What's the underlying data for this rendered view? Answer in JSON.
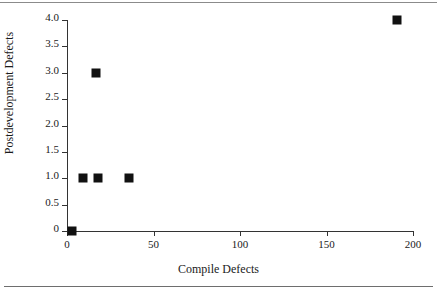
{
  "chart_data": {
    "type": "scatter",
    "title": "",
    "xlabel": "Compile Defects",
    "ylabel": "Postdevelopment Defects",
    "xlim": [
      0,
      200
    ],
    "ylim": [
      0,
      4.0
    ],
    "grid": false,
    "legend": null,
    "x_ticks": [
      {
        "value": 0,
        "label": "0"
      },
      {
        "value": 50,
        "label": "50"
      },
      {
        "value": 100,
        "label": "100"
      },
      {
        "value": 150,
        "label": "150"
      },
      {
        "value": 200,
        "label": "200"
      }
    ],
    "y_ticks": [
      {
        "value": 4.0,
        "label": "4.0"
      },
      {
        "value": 3.5,
        "label": "3.5"
      },
      {
        "value": 3.0,
        "label": "3.0"
      },
      {
        "value": 2.5,
        "label": "2.5"
      },
      {
        "value": 2.0,
        "label": "2.0"
      },
      {
        "value": 1.5,
        "label": "1.5"
      },
      {
        "value": 1.0,
        "label": "1.0"
      },
      {
        "value": 0.5,
        "label": "0.5"
      },
      {
        "value": 0,
        "label": "0"
      }
    ],
    "marker": {
      "shape": "square",
      "color": "#111111",
      "size_px": 9
    },
    "points": [
      {
        "x": 3,
        "y": 0
      },
      {
        "x": 9,
        "y": 1.0
      },
      {
        "x": 17,
        "y": 3.0
      },
      {
        "x": 18,
        "y": 1.0
      },
      {
        "x": 36,
        "y": 1.0
      },
      {
        "x": 191,
        "y": 4.0
      }
    ]
  }
}
